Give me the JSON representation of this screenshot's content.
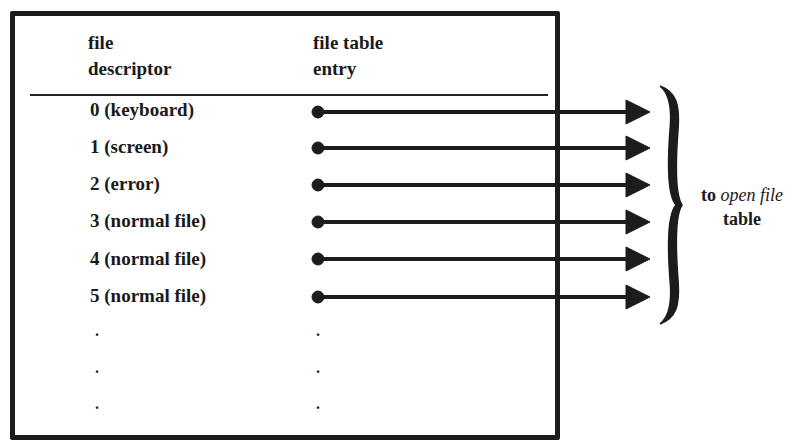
{
  "header": {
    "col1": [
      "file",
      "descriptor"
    ],
    "col2": [
      "file table",
      "entry"
    ]
  },
  "rows": [
    {
      "label": "0 (keyboard)"
    },
    {
      "label": "1 (screen)"
    },
    {
      "label": "2 (error)"
    },
    {
      "label": "3 (normal file)"
    },
    {
      "label": "4 (normal file)"
    },
    {
      "label": "5 (normal file)"
    }
  ],
  "ellipsis": [
    ".",
    ".",
    "."
  ],
  "side_label": {
    "prefix": "to ",
    "emphasis": "open file",
    "line2": "table"
  }
}
